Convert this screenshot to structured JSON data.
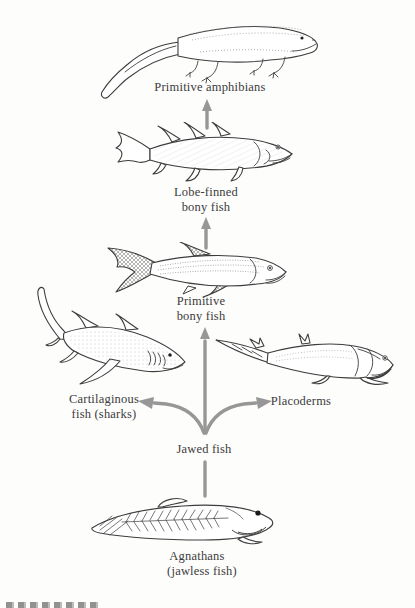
{
  "figure": {
    "type": "evolutionary-tree-illustration",
    "bg_color": "#fdfdfc",
    "arrow_color": "#979797",
    "ink_color": "#3d3d3d",
    "text_color": "#3b3b3b"
  },
  "labels": {
    "amphibians": "Primitive amphibians",
    "lobefinned_line1": "Lobe-finned",
    "lobefinned_line2": "bony fish",
    "primbony_line1": "Primitive",
    "primbony_line2": "bony fish",
    "cartilaginous_line1": "Cartilaginous",
    "cartilaginous_line2": "fish (sharks)",
    "placoderms": "Placoderms",
    "jawed": "Jawed fish",
    "agnathans_line1": "Agnathans",
    "agnathans_line2": "(jawless fish)"
  },
  "lineage_edges": [
    {
      "from": "Agnathans (jawless fish)",
      "to": "Jawed fish"
    },
    {
      "from": "Jawed fish",
      "to": "Cartilaginous fish (sharks)"
    },
    {
      "from": "Jawed fish",
      "to": "Placoderms"
    },
    {
      "from": "Jawed fish",
      "to": "Primitive bony fish"
    },
    {
      "from": "Primitive bony fish",
      "to": "Lobe-finned bony fish"
    },
    {
      "from": "Lobe-finned bony fish",
      "to": "Primitive amphibians"
    }
  ],
  "illustrations": [
    "primitive-amphibian",
    "lobe-finned-bony-fish",
    "primitive-bony-fish",
    "cartilaginous-shark",
    "placoderm",
    "agnathan-jawless-fish"
  ]
}
